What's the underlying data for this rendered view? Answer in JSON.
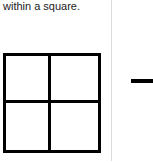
{
  "caption": "within a square.",
  "figure": {
    "shape": "square-divided-into-four",
    "border_color": "#000000",
    "divider_color": "#dcdcdc"
  },
  "right_panel": {
    "symbol": "minus-dash"
  }
}
